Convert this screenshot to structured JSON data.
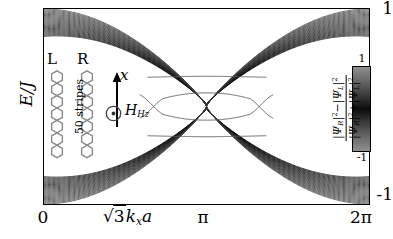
{
  "figure": {
    "kind": "band-structure-plot",
    "axes": {
      "ylabel": "E/J",
      "yticks": [
        "1",
        "-1"
      ],
      "ylim": [
        -1,
        1
      ],
      "xticks": [
        "0",
        "π",
        "2π"
      ],
      "xlim_labels": [
        "0",
        "2π"
      ],
      "xlabel_parts": {
        "radicand": "3",
        "k": "k",
        "k_sub": "x",
        "a": "a"
      }
    },
    "colorbar": {
      "max_label": "1",
      "min_label": "-1",
      "numerator": "|ΨR|² − |ΨL|²",
      "denominator": "|ΨR|² + |ΨL|²",
      "num_parts": {
        "psi1": "Ψ",
        "sub1": "R",
        "sup1": "2",
        "op": "−",
        "psi2": "Ψ",
        "sub2": "L",
        "sup2": "2"
      },
      "den_parts": {
        "psi1": "Ψ",
        "sub1": "R",
        "sup1": "2",
        "op": "+",
        "psi2": "Ψ",
        "sub2": "L",
        "sup2": "2"
      },
      "gradient_top_color": "#8f8f8f",
      "gradient_mid_color": "#0b0b0b",
      "gradient_bottom_color": "#8f8f8f"
    },
    "inset": {
      "left_label": "L",
      "right_label": "R",
      "stripes_label": "50 stripes",
      "axis_arrow_label": "x",
      "field_label": "Hz",
      "field_symbol": "⊙",
      "field_sub": "z",
      "lattice": "honeycomb-ribbon",
      "hex_rows": 7
    }
  },
  "chart_data": {
    "type": "line",
    "title": "",
    "xlabel": "√3 kx a",
    "ylabel": "E/J",
    "xlim": [
      0,
      6.283185
    ],
    "ylim": [
      -1,
      1
    ],
    "grid": false,
    "legend": "colorbar",
    "colormap": {
      "label": "(|ΨR|^2 - |ΨL|^2)/(|ΨR|^2 + |ΨL|^2)",
      "vmin": -1,
      "vmax": 1
    },
    "n_bulk_bands_per_manifold": 26,
    "bulk_band_envelope": {
      "upper_top_at_k0": 1.0,
      "upper_bottom_at_k0": 0.72,
      "upper_min_at_pi": 0.0,
      "dirac_points_x": [
        2.094,
        4.189
      ],
      "comment": "Upper manifold mirrors lower manifold about E=0; bands pinch toward E=0 near k=π."
    },
    "edge_states": [
      {
        "name": "flat-upper",
        "points": [
          [
            2.0,
            0.3
          ],
          [
            2.4,
            0.305
          ],
          [
            3.14,
            0.31
          ],
          [
            3.9,
            0.305
          ],
          [
            4.3,
            0.3
          ]
        ]
      },
      {
        "name": "flat-lower",
        "points": [
          [
            2.0,
            -0.3
          ],
          [
            2.4,
            -0.305
          ],
          [
            3.14,
            -0.31
          ],
          [
            3.9,
            -0.305
          ],
          [
            4.3,
            -0.3
          ]
        ]
      },
      {
        "name": "lens-upper",
        "points": [
          [
            1.85,
            -0.12
          ],
          [
            2.3,
            0.08
          ],
          [
            3.14,
            0.14
          ],
          [
            3.98,
            0.08
          ],
          [
            4.43,
            -0.12
          ]
        ]
      },
      {
        "name": "lens-lower",
        "points": [
          [
            1.85,
            0.12
          ],
          [
            2.3,
            -0.08
          ],
          [
            3.14,
            -0.14
          ],
          [
            3.98,
            -0.08
          ],
          [
            4.43,
            0.12
          ]
        ]
      },
      {
        "name": "crossing-left",
        "x_cross": 2.05,
        "y_cross": 0.0
      },
      {
        "name": "crossing-right",
        "x_cross": 4.23,
        "y_cross": 0.0
      }
    ]
  }
}
